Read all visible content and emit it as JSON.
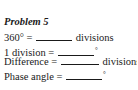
{
  "problem": {
    "title": "Problem 5",
    "rows": [
      {
        "label": "360° =",
        "unit": "divisions",
        "answer": ""
      },
      {
        "label": "1 division =",
        "unit": "°",
        "answer": ""
      },
      {
        "label": "Difference =",
        "unit": "divisions",
        "answer": ""
      },
      {
        "label": "Phase angle =",
        "unit": "°",
        "answer": ""
      }
    ]
  }
}
